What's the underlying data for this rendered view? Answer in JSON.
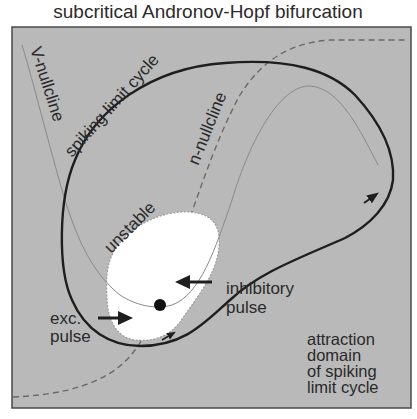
{
  "title": "subcritical Andronov-Hopf bifurcation",
  "colors": {
    "background": "#ffffff",
    "panel": "#b9b9b9",
    "frame": "#4a4a4a",
    "limit_cycle": "#1e1e1e",
    "v_nullcline": "#8a8a8a",
    "n_nullcline": "#6a6a6a",
    "unstable_region": "#ffffff",
    "fixed_point": "#111111",
    "text": "#2a2a2a"
  },
  "labels": {
    "v_nullcline": "V-nullcline",
    "n_nullcline": "n-nullcline",
    "limit_cycle": "spiking limit cycle",
    "unstable": "unstable",
    "exc_pulse_line1": "exc.",
    "exc_pulse_line2": "pulse",
    "inh_pulse_line1": "inhibitory",
    "inh_pulse_line2": "pulse",
    "domain_line1": "attraction",
    "domain_line2": "domain",
    "domain_line3": "of spiking",
    "domain_line4": "limit cycle"
  },
  "elements": {
    "fixed_point": {
      "label": "stable equilibrium",
      "x": 160,
      "y": 305
    },
    "excitatory_pulse_arrow": {
      "direction": "right"
    },
    "inhibitory_pulse_arrow": {
      "direction": "left"
    }
  }
}
